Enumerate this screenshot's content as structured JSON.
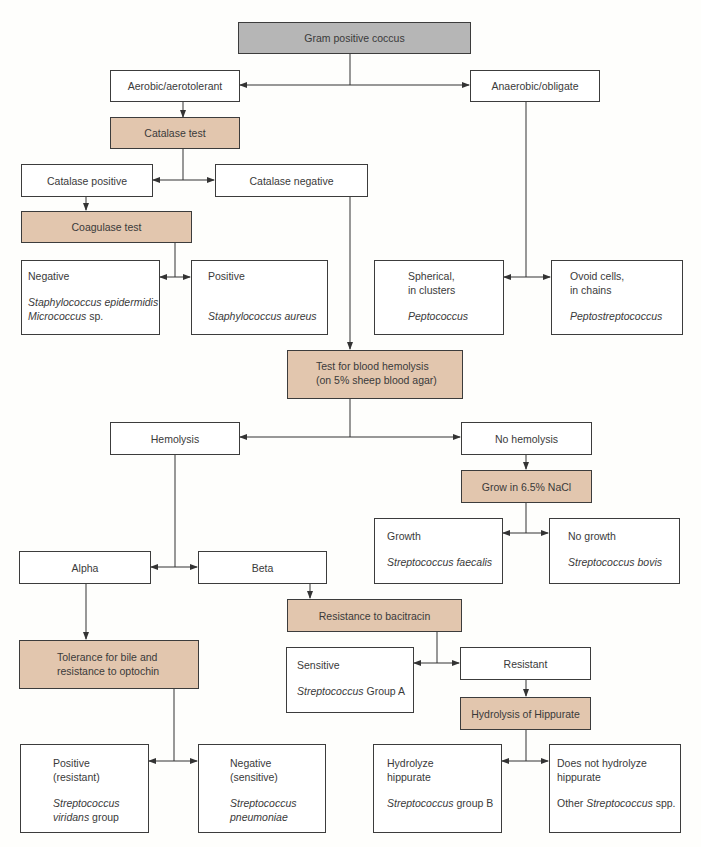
{
  "nodes": {
    "root": "Gram positive coccus",
    "aerobic": "Aerobic/aerotolerant",
    "anaerobic": "Anaerobic/obligate",
    "catalase_test": "Catalase test",
    "catalase_positive": "Catalase positive",
    "catalase_negative": "Catalase negative",
    "coagulase_test": "Coagulase test",
    "coag_negative": {
      "label": "Negative",
      "org1": "Staphylococcus epidermidis",
      "org2_italic": "Micrococcus",
      "org2_rest": " sp."
    },
    "coag_positive": {
      "label": "Positive",
      "org": "Staphylococcus aureus"
    },
    "spherical": {
      "line1": "Spherical,",
      "line2": "in clusters",
      "org": "Peptococcus"
    },
    "ovoid": {
      "line1": "Ovoid cells,",
      "line2": "in chains",
      "org": "Peptostreptococcus"
    },
    "hemolysis_test": {
      "line1": "Test for blood hemolysis",
      "line2": "(on 5% sheep blood agar)"
    },
    "hemolysis": "Hemolysis",
    "no_hemolysis": "No hemolysis",
    "nacl_test": "Grow in 6.5% NaCl",
    "growth": {
      "label": "Growth",
      "org": "Streptococcus faecalis"
    },
    "no_growth": {
      "label": "No growth",
      "org": "Streptococcus bovis"
    },
    "alpha": "Alpha",
    "beta": "Beta",
    "bacitracin_test": "Resistance to bacitracin",
    "sensitive": {
      "label": "Sensitive",
      "org_italic": "Streptococcus",
      "org_rest": " Group A"
    },
    "resistant": "Resistant",
    "hippurate_test": "Hydrolysis of Hippurate",
    "optochin_test": {
      "line1": "Tolerance for bile and",
      "line2": "resistance to optochin"
    },
    "opto_positive": {
      "line1": "Positive",
      "line2": "(resistant)",
      "org1": "Streptococcus",
      "org2_italic": "viridans",
      "org2_rest": " group"
    },
    "opto_negative": {
      "line1": "Negative",
      "line2": "(sensitive)",
      "org1": "Streptococcus",
      "org2": "pneumoniae"
    },
    "hydrolyze": {
      "line1": "Hydrolyze",
      "line2": "hippurate",
      "org_italic": "Streptococcus",
      "org_rest": " group B"
    },
    "no_hydrolyze": {
      "line1": "Does not hydrolyze",
      "line2": "hippurate",
      "org_pre": "Other ",
      "org_italic": "Streptococcus",
      "org_rest": " spp."
    }
  },
  "colors": {
    "test_fill": "#e2c6ae",
    "root_fill": "#b6b6b6",
    "line": "#333333"
  }
}
